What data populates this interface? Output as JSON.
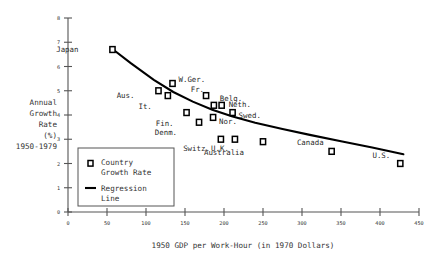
{
  "chart_data": {
    "type": "scatter",
    "title": "",
    "xlabel": "1950 GDP per Work-Hour (in 1970 Dollars)",
    "ylabel": "Annual Growth Rate (%) 1950-1979",
    "ylabel_lines": [
      "Annual",
      "Growth",
      "Rate",
      "(%)",
      "1950-1979"
    ],
    "xlim": [
      0,
      450
    ],
    "ylim": [
      0,
      8
    ],
    "xticks": [
      0,
      50,
      100,
      150,
      200,
      250,
      300,
      350,
      400,
      450
    ],
    "yticks": [
      0,
      1,
      2,
      3,
      4,
      5,
      6,
      7,
      8
    ],
    "xtick_labels": [
      "0",
      "50",
      "100",
      "150",
      "200",
      "250",
      "300",
      "350",
      "400",
      "450"
    ],
    "ytick_labels": [
      "0",
      "1",
      "2",
      "3",
      "4",
      "5",
      "6",
      "7",
      "8"
    ],
    "grid": false,
    "legend_position": "lower-left-inside",
    "series": [
      {
        "name": "Country Growth Rate",
        "type": "scatter",
        "marker": "open-square",
        "points": [
          {
            "label": "Japan",
            "x": 57,
            "y": 6.7,
            "label_dx": -34,
            "label_dy": 2
          },
          {
            "label": "Aus.",
            "x": 116,
            "y": 5.0,
            "label_dx": -24,
            "label_dy": 7
          },
          {
            "label": "It.",
            "x": 128,
            "y": 4.8,
            "label_dx": -16,
            "label_dy": 13
          },
          {
            "label": "W.Ger.",
            "x": 134,
            "y": 5.3,
            "label_dx": 6,
            "label_dy": -1
          },
          {
            "label": "Fin.",
            "x": 152,
            "y": 4.1,
            "label_dx": -13,
            "label_dy": 13
          },
          {
            "label": "Fr.",
            "x": 177,
            "y": 4.8,
            "label_dx": -2,
            "label_dy": -4
          },
          {
            "label": "Denm.",
            "x": 168,
            "y": 3.7,
            "label_dx": -22,
            "label_dy": 13
          },
          {
            "label": "Belg.",
            "x": 187,
            "y": 4.4,
            "label_dx": 6,
            "label_dy": -4
          },
          {
            "label": "Nor.",
            "x": 186,
            "y": 3.9,
            "label_dx": 6,
            "label_dy": 7
          },
          {
            "label": "Neth.",
            "x": 197,
            "y": 4.4,
            "label_dx": 7,
            "label_dy": 2
          },
          {
            "label": "Swed.",
            "x": 211,
            "y": 4.1,
            "label_dx": 6,
            "label_dy": 5
          },
          {
            "label": "Switz.",
            "x": 196,
            "y": 3.0,
            "label_dx": -11,
            "label_dy": 12
          },
          {
            "label": "U.K.",
            "x": 214,
            "y": 3.0,
            "label_dx": -6,
            "label_dy": 12
          },
          {
            "label": "Australia",
            "x": 250,
            "y": 2.9,
            "label_dx": -19,
            "label_dy": 13
          },
          {
            "label": "Canada",
            "x": 338,
            "y": 2.5,
            "label_dx": -8,
            "label_dy": -6
          },
          {
            "label": "U.S.",
            "x": 426,
            "y": 2.0,
            "label_dx": -10,
            "label_dy": -6
          }
        ]
      },
      {
        "name": "Regression Line",
        "type": "line",
        "points": [
          {
            "x": 57,
            "y": 6.72
          },
          {
            "x": 80,
            "y": 6.15
          },
          {
            "x": 110,
            "y": 5.45
          },
          {
            "x": 135,
            "y": 4.95
          },
          {
            "x": 160,
            "y": 4.55
          },
          {
            "x": 185,
            "y": 4.22
          },
          {
            "x": 210,
            "y": 3.95
          },
          {
            "x": 240,
            "y": 3.68
          },
          {
            "x": 275,
            "y": 3.42
          },
          {
            "x": 310,
            "y": 3.18
          },
          {
            "x": 350,
            "y": 2.92
          },
          {
            "x": 390,
            "y": 2.66
          },
          {
            "x": 430,
            "y": 2.38
          }
        ]
      }
    ]
  },
  "legend": {
    "entries": [
      {
        "marker": "square-icon",
        "line1": "Country",
        "line2": "Growth Rate"
      },
      {
        "marker": "line-icon",
        "line1": "Regression",
        "line2": "Line"
      }
    ]
  }
}
